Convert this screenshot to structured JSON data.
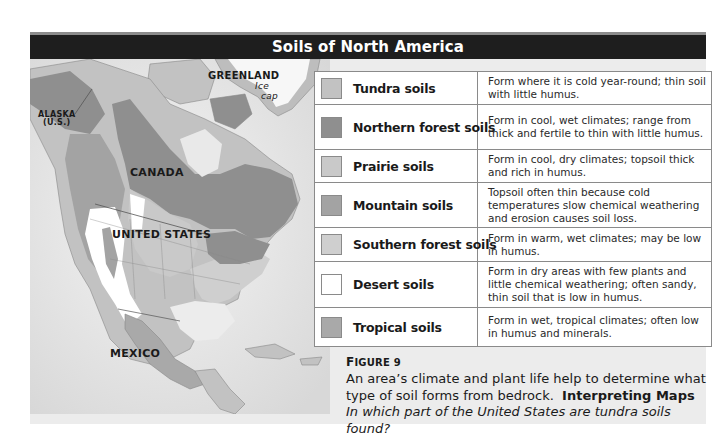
{
  "title": "Soils of North America",
  "map": {
    "labels": {
      "alaska_line1": "ALASKA",
      "alaska_line2": "(U.S.)",
      "greenland": "GREENLAND",
      "ice_cap_line1": "Ice",
      "ice_cap_line2": "cap",
      "canada": "CANADA",
      "united_states": "UNITED STATES",
      "mexico": "MEXICO"
    },
    "colors": {
      "ocean": "#e6e6e6",
      "tundra": "#c2c2c2",
      "northern_forest": "#8f8f8f",
      "prairie": "#c9c9c9",
      "mountain": "#a3a3a3",
      "southern_forest": "#cfcfcf",
      "desert": "#ffffff",
      "tropical": "#a9a9a9",
      "ice_cap": "#f7f7f7"
    }
  },
  "legend": {
    "rows": [
      {
        "name": "Tundra soils",
        "color": "#c2c2c2",
        "description": "Form where it is cold year-round; thin soil with little humus."
      },
      {
        "name": "Northern forest soils",
        "color": "#8f8f8f",
        "description": "Form in cool, wet climates; range from thick and fertile to thin with little humus."
      },
      {
        "name": "Prairie soils",
        "color": "#c9c9c9",
        "description": "Form in cool, dry climates; topsoil thick and rich in humus."
      },
      {
        "name": "Mountain soils",
        "color": "#a3a3a3",
        "description": "Topsoil often thin because cold temperatures slow chemical weathering and erosion causes soil loss."
      },
      {
        "name": "Southern forest soils",
        "color": "#cfcfcf",
        "description": "Form in warm, wet climates; may be low in humus."
      },
      {
        "name": "Desert soils",
        "color": "#ffffff",
        "description": "Form in dry areas with few plants and little chemical weathering; often sandy, thin soil that is low in humus."
      },
      {
        "name": "Tropical soils",
        "color": "#a9a9a9",
        "description": "Form in wet, tropical climates; often low in humus and minerals."
      }
    ]
  },
  "caption": {
    "figure_first": "F",
    "figure_rest": "IGURE 9",
    "body": "An area’s climate and plant life help to determine what type of soil forms from bedrock.",
    "skill_label": "Interpreting Maps",
    "question": "In which part of the United States are tundra soils found?"
  }
}
